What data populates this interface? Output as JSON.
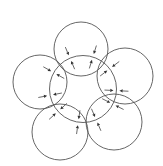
{
  "canvas": {
    "width": 163,
    "height": 166,
    "background": "#ffffff"
  },
  "colors": {
    "stroke": "#555555",
    "arrow": "#333333"
  },
  "central_circle": {
    "cx": 83,
    "cy": 89,
    "r": 33.5
  },
  "petals": [
    {
      "name": "top",
      "cx": 81,
      "cy": 49,
      "r": 27
    },
    {
      "name": "upper-right",
      "cx": 125,
      "cy": 76,
      "r": 28
    },
    {
      "name": "lower-right",
      "cx": 114,
      "cy": 122,
      "r": 28
    },
    {
      "name": "lower-left",
      "cx": 60,
      "cy": 132,
      "r": 28
    },
    {
      "name": "left",
      "cx": 40,
      "cy": 82,
      "r": 27
    }
  ],
  "arrows": {
    "angle_offsets_deg": [
      -20,
      20
    ],
    "outer_from": 12,
    "outer_to": 3,
    "inner_from": 12,
    "inner_to": 3,
    "head_length": 3.2,
    "head_width": 1.6
  }
}
